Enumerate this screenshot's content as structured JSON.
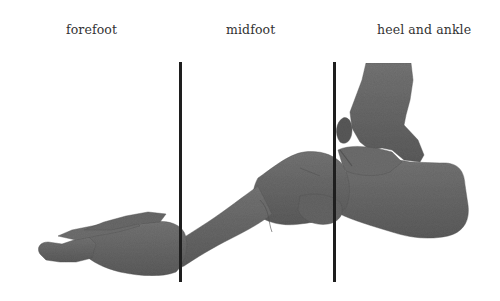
{
  "diagram": {
    "regions": [
      {
        "label": "forefoot"
      },
      {
        "label": "midfoot"
      },
      {
        "label": "heel and ankle"
      }
    ],
    "dividers": [
      {
        "x": 180,
        "y_top": 62,
        "y_bottom": 282
      },
      {
        "x": 334,
        "y_top": 62,
        "y_bottom": 282
      }
    ],
    "colors": {
      "background": "#ffffff",
      "bone": "#6a6a6a",
      "bone_shadow": "#4a4a4a",
      "divider_line": "#1e1e1e",
      "label_text": "#333333"
    }
  }
}
